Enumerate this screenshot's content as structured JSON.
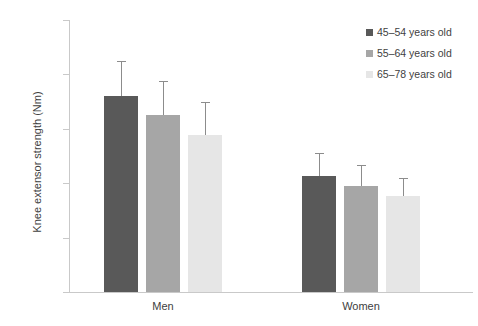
{
  "chart_data": {
    "type": "bar",
    "title": "",
    "subtitle": "",
    "xlabel": "",
    "ylabel": "Knee extensor strength (Nm)",
    "categories": [
      "Men",
      "Women"
    ],
    "ylim": [
      0,
      250
    ],
    "yticks": [
      0,
      50,
      100,
      150,
      200,
      250
    ],
    "ytick_labels": [
      "0",
      "50",
      "100",
      "150",
      "200",
      "250"
    ],
    "grid": false,
    "legend_position": "top-right",
    "error_bars": "upper-only",
    "series": [
      {
        "name": "45–54 years old",
        "color": "#595959",
        "values": [
          180,
          107
        ],
        "errors_upper": [
          212,
          128
        ]
      },
      {
        "name": "55–64 years old",
        "color": "#a6a6a6",
        "values": [
          163,
          97
        ],
        "errors_upper": [
          194,
          117
        ]
      },
      {
        "name": "65–78 years old",
        "color": "#e6e6e6",
        "values": [
          144,
          88
        ],
        "errors_upper": [
          175,
          105
        ]
      }
    ]
  },
  "axis": {
    "line_color": "#c9c9c9",
    "tick_color": "#c9c9c9",
    "text_color": "#404040"
  },
  "legend": {
    "items": [
      {
        "label": "45–54 years old",
        "color": "#595959"
      },
      {
        "label": "55–64 years old",
        "color": "#a6a6a6"
      },
      {
        "label": "65–78 years old",
        "color": "#e6e6e6"
      }
    ]
  }
}
